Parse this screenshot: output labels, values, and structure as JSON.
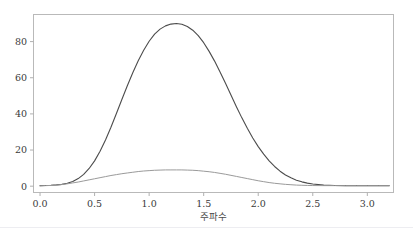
{
  "chart_data": {
    "type": "line",
    "title": "",
    "subtitle": "",
    "xlabel": "주파수",
    "ylabel": "",
    "xlim": [
      -0.06,
      3.24
    ],
    "ylim": [
      -3.5,
      95
    ],
    "grid": false,
    "legend": null,
    "xticks": [
      "0.0",
      "0.5",
      "1.0",
      "1.5",
      "2.0",
      "2.5",
      "3.0"
    ],
    "xtick_values": [
      0.0,
      0.5,
      1.0,
      1.5,
      2.0,
      2.5,
      3.0
    ],
    "yticks": [
      "0",
      "20",
      "40",
      "60",
      "80"
    ],
    "ytick_values": [
      0,
      20,
      40,
      60,
      80
    ],
    "series": [
      {
        "name": "main-peak",
        "color": "#4c4c4c",
        "linewidth": 1.1,
        "peak_x": 1.25,
        "peak_y": 90,
        "x": [
          0.0,
          0.05,
          0.1,
          0.15,
          0.2,
          0.25,
          0.3,
          0.35,
          0.4,
          0.45,
          0.5,
          0.55,
          0.6,
          0.65,
          0.7,
          0.75,
          0.8,
          0.85,
          0.9,
          0.95,
          1.0,
          1.05,
          1.1,
          1.15,
          1.2,
          1.25,
          1.3,
          1.35,
          1.4,
          1.45,
          1.5,
          1.55,
          1.6,
          1.65,
          1.7,
          1.75,
          1.8,
          1.85,
          1.9,
          1.95,
          2.0,
          2.05,
          2.1,
          2.15,
          2.2,
          2.25,
          2.3,
          2.35,
          2.4,
          2.45,
          2.5,
          2.6,
          2.7,
          2.8,
          2.9,
          3.0,
          3.1,
          3.2
        ],
        "y": [
          0.3,
          0.4,
          0.5,
          0.7,
          1.0,
          1.6,
          2.6,
          4.2,
          6.5,
          9.8,
          14.0,
          19.3,
          25.6,
          32.6,
          40.2,
          48.0,
          55.6,
          62.8,
          69.4,
          75.2,
          80.2,
          84.1,
          86.9,
          88.7,
          89.7,
          90.0,
          89.6,
          88.4,
          86.3,
          83.3,
          79.4,
          74.6,
          69.2,
          63.2,
          56.9,
          50.4,
          44.0,
          37.8,
          32.0,
          26.7,
          21.9,
          17.7,
          14.0,
          10.9,
          8.3,
          6.2,
          4.6,
          3.3,
          2.4,
          1.7,
          1.2,
          0.6,
          0.4,
          0.3,
          0.3,
          0.3,
          0.3,
          0.3
        ]
      },
      {
        "name": "secondary-broad",
        "color": "#9a9a9a",
        "linewidth": 1.0,
        "peak_x": 1.3,
        "peak_y": 9.0,
        "x": [
          0.0,
          0.05,
          0.1,
          0.15,
          0.2,
          0.25,
          0.3,
          0.35,
          0.4,
          0.45,
          0.5,
          0.55,
          0.6,
          0.65,
          0.7,
          0.75,
          0.8,
          0.85,
          0.9,
          0.95,
          1.0,
          1.05,
          1.1,
          1.15,
          1.2,
          1.25,
          1.3,
          1.35,
          1.4,
          1.45,
          1.5,
          1.55,
          1.6,
          1.65,
          1.7,
          1.75,
          1.8,
          1.85,
          1.9,
          1.95,
          2.0,
          2.05,
          2.1,
          2.15,
          2.2,
          2.25,
          2.3,
          2.35,
          2.4,
          2.45,
          2.5,
          2.6,
          2.7,
          2.8,
          2.9,
          3.0,
          3.1,
          3.2
        ],
        "y": [
          0.2,
          0.3,
          0.4,
          0.6,
          0.9,
          1.3,
          1.8,
          2.3,
          2.9,
          3.5,
          4.1,
          4.7,
          5.3,
          5.9,
          6.4,
          6.9,
          7.3,
          7.7,
          8.1,
          8.4,
          8.6,
          8.8,
          8.9,
          9.0,
          9.0,
          9.0,
          9.0,
          8.9,
          8.8,
          8.6,
          8.3,
          8.0,
          7.6,
          7.1,
          6.6,
          6.0,
          5.4,
          4.8,
          4.2,
          3.6,
          3.0,
          2.5,
          2.0,
          1.6,
          1.3,
          1.0,
          0.8,
          0.6,
          0.5,
          0.4,
          0.35,
          0.3,
          0.3,
          0.3,
          0.3,
          0.3,
          0.3,
          0.3
        ]
      }
    ]
  },
  "figure": {
    "background": "#ffffff",
    "spine_color": "#b9b9b9",
    "tick_color": "#b0b0b0",
    "tick_text_color": "#3a3a3a",
    "axis_title_color": "#4a4a4a"
  }
}
